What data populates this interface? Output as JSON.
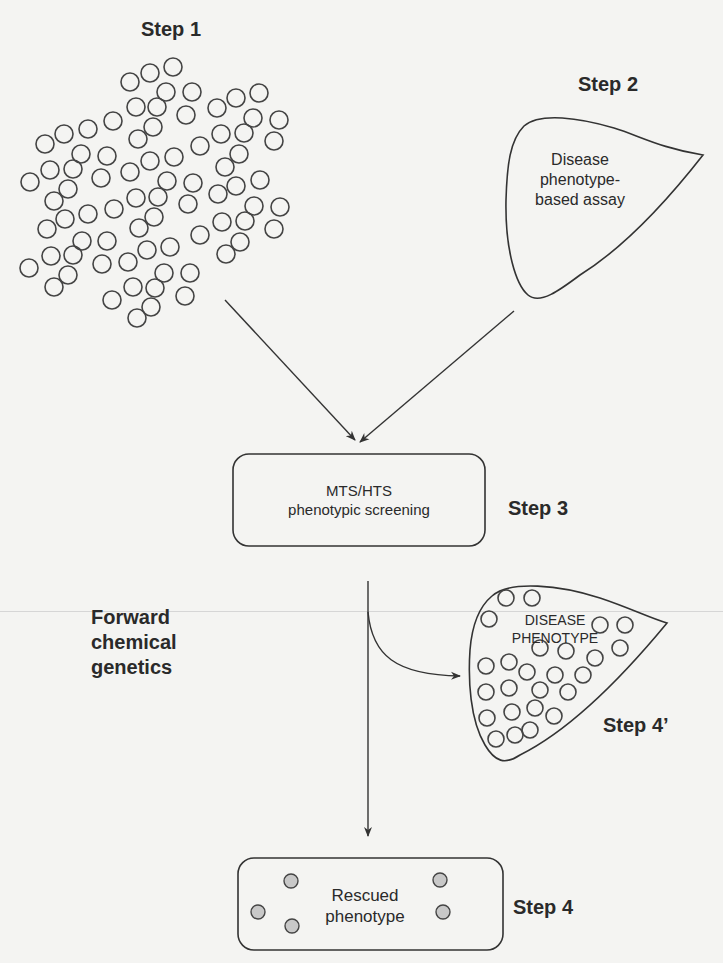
{
  "diagram": {
    "steps": {
      "step1": {
        "label": "Step 1"
      },
      "step2": {
        "label": "Step 2",
        "shape_text": [
          "Disease",
          "phenotype-",
          "based assay"
        ]
      },
      "step3": {
        "label": "Step 3",
        "box_text": [
          "MTS/HTS",
          "phenotypic screening"
        ]
      },
      "step4_prime": {
        "label": "Step 4’",
        "shape_text": [
          "DISEASE",
          "PHENOTYPE"
        ]
      },
      "step4": {
        "label": "Step 4",
        "box_text": [
          "Rescued",
          "phenotype"
        ]
      }
    },
    "side_label": [
      "Forward",
      "chemical",
      "genetics"
    ],
    "colors": {
      "line": "#333333",
      "rescued_fill": "#c8c8c8",
      "background": "#f4f4f2"
    }
  }
}
